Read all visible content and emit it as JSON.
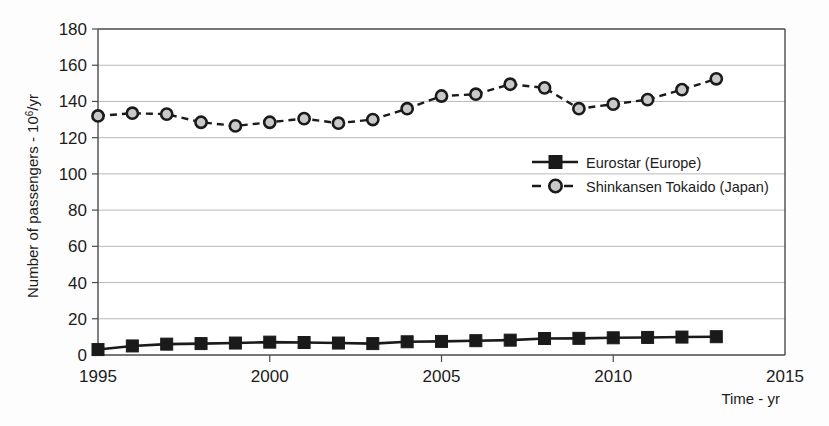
{
  "chart_data": {
    "type": "line",
    "title": "",
    "xlabel": "Time - yr",
    "ylabel": "Number of passengers - 10^6/yr",
    "ylabel_prefix": "Number of passengers - 10",
    "ylabel_exponent": "6",
    "ylabel_suffix": "/yr",
    "xlim": [
      1995,
      2015
    ],
    "ylim": [
      0,
      180
    ],
    "grid": true,
    "legend_position": "center-right",
    "x": [
      1995,
      1996,
      1997,
      1998,
      1999,
      2000,
      2001,
      2002,
      2003,
      2004,
      2005,
      2006,
      2007,
      2008,
      2009,
      2010,
      2011,
      2012,
      2013
    ],
    "xticks": [
      "1995",
      "2000",
      "2005",
      "2010",
      "2015"
    ],
    "xtick_values": [
      1995,
      2000,
      2005,
      2010,
      2015
    ],
    "yticks": [
      "0",
      "20",
      "40",
      "60",
      "80",
      "100",
      "120",
      "140",
      "160",
      "180"
    ],
    "ytick_values": [
      0,
      20,
      40,
      60,
      80,
      100,
      120,
      140,
      160,
      180
    ],
    "series": [
      {
        "name": "Eurostar (Europe)",
        "marker": "filled-square",
        "linestyle": "solid",
        "color": "#1a1a1a",
        "values": [
          3,
          5,
          6,
          6.3,
          6.6,
          7.1,
          6.9,
          6.6,
          6.3,
          7.3,
          7.5,
          7.9,
          8.2,
          9.1,
          9.2,
          9.5,
          9.7,
          9.9,
          10.1
        ]
      },
      {
        "name": "Shinkansen Tokaido (Japan)",
        "marker": "open-circle",
        "linestyle": "dashed",
        "color": "#1a1a1a",
        "values": [
          132,
          133.5,
          133,
          128.5,
          126.5,
          128.5,
          130.5,
          128,
          130,
          136,
          143,
          144,
          149.5,
          147.5,
          136,
          138.5,
          141,
          146.5,
          152.5
        ]
      }
    ]
  },
  "legend": {
    "entries": [
      {
        "label": "Eurostar (Europe)"
      },
      {
        "label": "Shinkansen Tokaido (Japan)"
      }
    ]
  }
}
